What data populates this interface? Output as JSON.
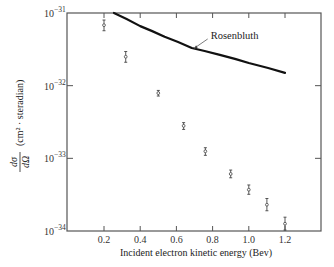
{
  "chart_data": {
    "type": "scatter",
    "title": "",
    "xlabel": "Incident electron kinetic energy (Bev)",
    "ylabel": "dσ/dΩ (cm² / steradian)",
    "xlim": [
      0.0,
      1.4
    ],
    "ylim": [
      1e-34,
      1e-31
    ],
    "yscale": "log",
    "grid": false,
    "legend_position": "none",
    "x_ticks": [
      0.2,
      0.4,
      0.6,
      0.8,
      1.0,
      1.2
    ],
    "x_tick_labels": [
      "0.2",
      "0.4",
      "0.6",
      "0.8",
      "1.0",
      "1.2"
    ],
    "y_ticks": [
      1e-34,
      1e-33,
      1e-32,
      1e-31
    ],
    "y_tick_labels": [
      {
        "base": "10",
        "exp": "−34"
      },
      {
        "base": "10",
        "exp": "−33"
      },
      {
        "base": "10",
        "exp": "−32"
      },
      {
        "base": "10",
        "exp": "−31"
      }
    ],
    "series": [
      {
        "name": "Measured",
        "style": "points-with-error-bars",
        "x": [
          0.2,
          0.32,
          0.5,
          0.64,
          0.76,
          0.9,
          1.0,
          1.1,
          1.2
        ],
        "y": [
          6.8e-32,
          2.5e-32,
          7.9e-33,
          2.8e-33,
          1.25e-33,
          6.1e-34,
          3.7e-34,
          2.3e-34,
          1.26e-34
        ],
        "y_err_low": [
          5.7e-32,
          2.1e-32,
          7.2e-33,
          2.5e-33,
          1.1e-33,
          5.4e-34,
          3.2e-34,
          1.9e-34,
          1.03e-34
        ],
        "y_err_high": [
          8e-32,
          2.95e-32,
          8.6e-33,
          3.1e-33,
          1.4e-33,
          6.9e-34,
          4.3e-34,
          2.8e-34,
          1.55e-34
        ]
      },
      {
        "name": "Rosenbluth",
        "style": "line",
        "x": [
          0.255,
          0.4,
          0.535,
          0.685,
          0.84,
          1.0,
          1.2
        ],
        "y": [
          1e-31,
          6.6e-32,
          4.7e-32,
          3.3e-32,
          2.65e-32,
          2.05e-32,
          1.5e-32
        ]
      }
    ],
    "annotations": [
      {
        "text": "Rosenbluth",
        "points_to": {
          "x": 0.69,
          "y": 3.2e-32
        }
      }
    ]
  },
  "labels": {
    "ylabel_main": "dσ",
    "ylabel_den": "dΩ",
    "ylabel_units": "(cm² · steradian)"
  }
}
